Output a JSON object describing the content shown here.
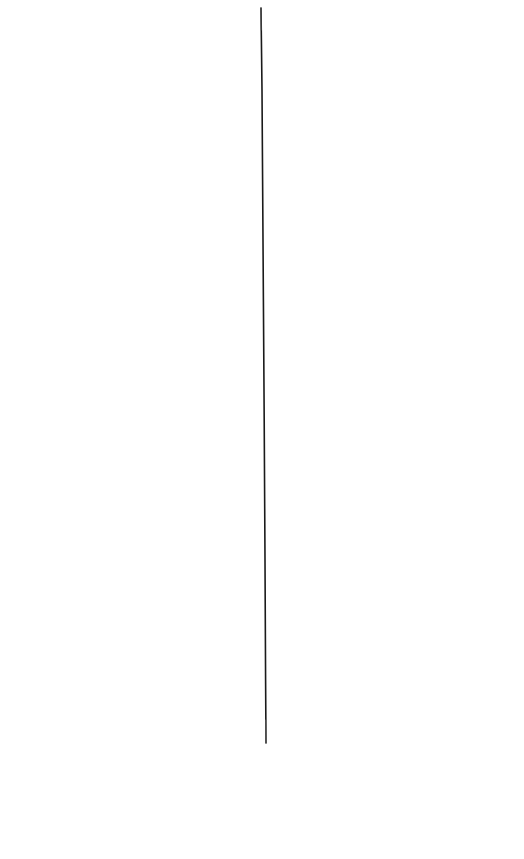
{
  "canvas": {
    "width": 524,
    "height": 859,
    "background": "#ffffff"
  },
  "stroke": {
    "color": "#1a1a1a",
    "x1": 261,
    "y1": 8,
    "x2": 266,
    "y2": 743,
    "width": 1.6
  }
}
